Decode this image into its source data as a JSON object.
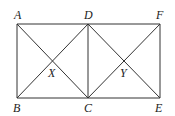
{
  "diagram": {
    "stroke_color": "#333333",
    "points": {
      "A": {
        "label": "A",
        "x": 17,
        "y": 24
      },
      "D": {
        "label": "D",
        "x": 88,
        "y": 24
      },
      "F": {
        "label": "F",
        "x": 160,
        "y": 24
      },
      "B": {
        "label": "B",
        "x": 17,
        "y": 98
      },
      "C": {
        "label": "C",
        "x": 88,
        "y": 98
      },
      "E": {
        "label": "E",
        "x": 160,
        "y": 98
      },
      "X": {
        "label": "X",
        "x": 53,
        "y": 61
      },
      "Y": {
        "label": "Y",
        "x": 124,
        "y": 61
      }
    },
    "segments": [
      [
        "A",
        "F"
      ],
      [
        "B",
        "E"
      ],
      [
        "A",
        "B"
      ],
      [
        "D",
        "C"
      ],
      [
        "F",
        "E"
      ],
      [
        "A",
        "C"
      ],
      [
        "B",
        "D"
      ],
      [
        "D",
        "E"
      ],
      [
        "C",
        "F"
      ]
    ]
  }
}
